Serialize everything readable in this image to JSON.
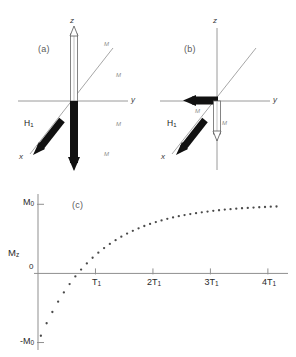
{
  "figure": {
    "background": "#ffffff",
    "ink": "#2a2a2a",
    "axis_color": "#8f8f8f",
    "vector_color": "#111111",
    "dot_color": "#4a4a4a"
  },
  "panel_a": {
    "tag": "(a)",
    "axes": [
      {
        "name": "z",
        "label": "z"
      },
      {
        "name": "y",
        "label": "y"
      },
      {
        "name": "x",
        "label": "x"
      }
    ],
    "vectors": [
      {
        "name": "h1-field",
        "label": "H",
        "sublabel": "1",
        "direction": "-x",
        "style": "solid-thick"
      },
      {
        "name": "magnetization-down",
        "label": "",
        "sublabel": "",
        "direction": "-z",
        "style": "solid-thick"
      },
      {
        "name": "magnetization-up-outline",
        "label": "",
        "sublabel": "",
        "direction": "+z",
        "style": "outline"
      }
    ],
    "tiny_labels": [
      {
        "name": "tiny-label-upper-diag",
        "text": "M"
      },
      {
        "name": "tiny-label-mid-right",
        "text": "M"
      },
      {
        "name": "tiny-label-lower-right",
        "text": "M"
      },
      {
        "name": "tiny-label-bottom-right",
        "text": "M"
      }
    ]
  },
  "panel_b": {
    "tag": "(b)",
    "axes": [
      {
        "name": "z",
        "label": "z"
      },
      {
        "name": "y",
        "label": "y"
      },
      {
        "name": "x",
        "label": "x"
      }
    ],
    "vectors": [
      {
        "name": "h1-field",
        "label": "H",
        "sublabel": "1",
        "direction": "-x",
        "style": "solid-thick"
      },
      {
        "name": "magnetization-minus-y",
        "label": "",
        "sublabel": "",
        "direction": "-y",
        "style": "solid-thick"
      },
      {
        "name": "magnetization-down-outline",
        "label": "",
        "sublabel": "",
        "direction": "-z",
        "style": "outline"
      }
    ],
    "tiny_labels": [
      {
        "name": "tiny-label-left-diag",
        "text": "M"
      },
      {
        "name": "tiny-label-center",
        "text": "M"
      }
    ]
  },
  "chart_data": {
    "type": "scatter",
    "title": "(c)",
    "xlabel": "",
    "ylabel": "Mz",
    "xlim": [
      0,
      4.35
    ],
    "ylim": [
      -1.05,
      1.12
    ],
    "grid": false,
    "legend": null,
    "y_ticks": [
      {
        "value": 1,
        "label": "M0",
        "base": "M",
        "sub": "0"
      },
      {
        "value": 0,
        "label": "0",
        "base": "0",
        "sub": ""
      },
      {
        "value": -1,
        "label": "-M0",
        "base": "-M",
        "sub": "0"
      }
    ],
    "y_axis_annotation": {
      "base": "M",
      "sub": "z"
    },
    "x_ticks": [
      {
        "value": 1,
        "base": "T",
        "sub": "1"
      },
      {
        "value": 2,
        "base": "2T",
        "sub": "1"
      },
      {
        "value": 3,
        "base": "3T",
        "sub": "1"
      },
      {
        "value": 4,
        "base": "4T",
        "sub": "1"
      }
    ],
    "equation": "Mz = M0 (1 - 2 exp(-t/T1))",
    "zero_crossing": 0.693,
    "x": [
      0.05,
      0.15,
      0.25,
      0.35,
      0.45,
      0.55,
      0.65,
      0.75,
      0.85,
      0.95,
      1.05,
      1.15,
      1.25,
      1.35,
      1.45,
      1.55,
      1.65,
      1.75,
      1.85,
      1.95,
      2.05,
      2.15,
      2.25,
      2.35,
      2.45,
      2.55,
      2.65,
      2.75,
      2.85,
      2.95,
      3.05,
      3.15,
      3.25,
      3.35,
      3.45,
      3.55,
      3.65,
      3.75,
      3.85,
      3.95,
      4.05,
      4.15
    ],
    "y": [
      -0.902,
      -0.721,
      -0.558,
      -0.409,
      -0.275,
      -0.154,
      -0.044,
      0.055,
      0.145,
      0.227,
      0.3,
      0.367,
      0.427,
      0.481,
      0.531,
      0.576,
      0.616,
      0.653,
      0.686,
      0.716,
      0.743,
      0.767,
      0.79,
      0.81,
      0.828,
      0.844,
      0.859,
      0.872,
      0.884,
      0.895,
      0.905,
      0.914,
      0.923,
      0.93,
      0.937,
      0.943,
      0.948,
      0.953,
      0.957,
      0.961,
      0.965,
      0.968
    ]
  }
}
